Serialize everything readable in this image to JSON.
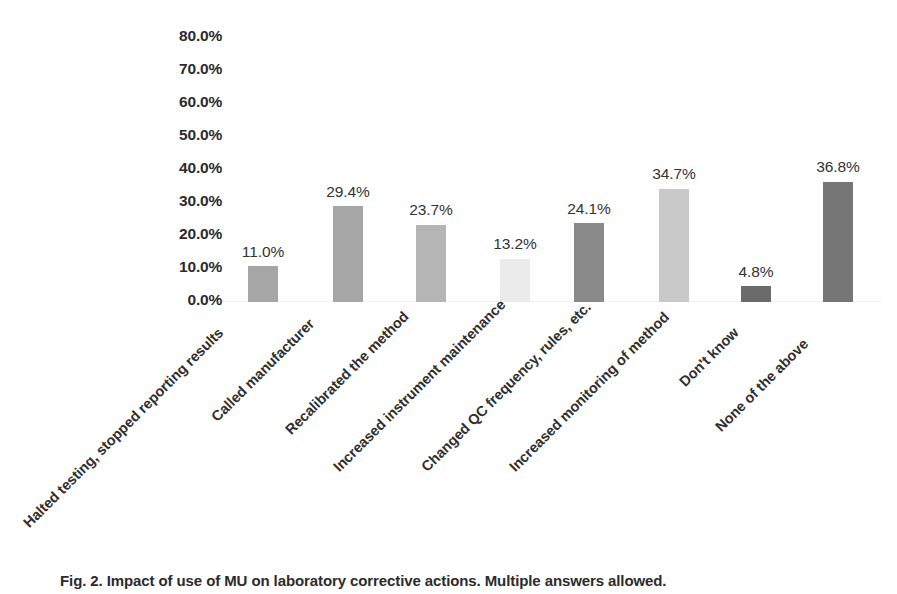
{
  "chart_data": {
    "type": "bar",
    "title": "",
    "xlabel": "",
    "ylabel": "",
    "ylim": [
      0,
      80
    ],
    "grid": false,
    "legend": "none",
    "y_tick_labels": [
      "80.0%",
      "70.0%",
      "60.0%",
      "50.0%",
      "40.0%",
      "30.0%",
      "20.0%",
      "10.0%",
      "0.0%"
    ],
    "y_tick_values": [
      80,
      70,
      60,
      50,
      40,
      30,
      20,
      10,
      0
    ],
    "categories": [
      "Halted testing, stopped reporting results",
      "Called manufacturer",
      "Recalibrated the method",
      "Increased instrument maintenance",
      "Changed QC frequency, rules, etc.",
      "Increased monitoring of method",
      "Don't know",
      "None of the above"
    ],
    "values": [
      11.0,
      29.4,
      23.7,
      13.2,
      24.1,
      34.7,
      4.8,
      36.8
    ],
    "data_labels": [
      "11.0%",
      "29.4%",
      "23.7%",
      "13.2%",
      "24.1%",
      "34.7%",
      "4.8%",
      "36.8%"
    ],
    "bar_colors": [
      "#a6a6a6",
      "#a6a6a6",
      "#b5b5b5",
      "#ebebeb",
      "#8a8a8a",
      "#c9c9c9",
      "#6b6b6b",
      "#767676"
    ]
  },
  "caption": {
    "text": "Fig. 2. Impact of use of MU on laboratory corrective actions. Multiple answers allowed."
  }
}
